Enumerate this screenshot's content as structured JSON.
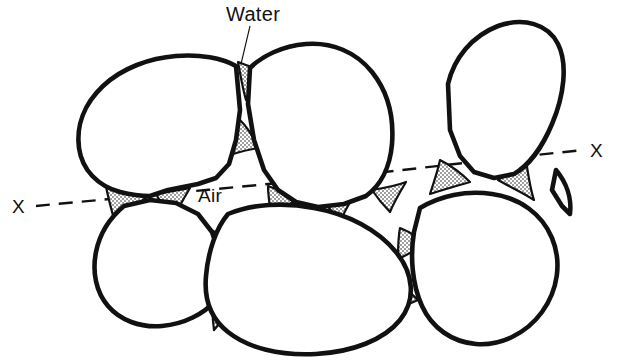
{
  "figure": {
    "kind": "soil-particle-water-air-diagram",
    "title": "",
    "background_color": "#ffffff",
    "ink_color": "#111111",
    "outline_color": "#111111",
    "water_fill_label": "stipple",
    "air_fill_color": "#ffffff"
  },
  "labels": {
    "water": "Water",
    "air": "Air",
    "section_left": "X",
    "section_right": "X"
  },
  "annotations": {
    "leader_line": {
      "from_label": "Water",
      "x1": 250,
      "y1": 26,
      "x2": 241,
      "y2": 64
    },
    "section_line": {
      "style": "dashed",
      "label": "X",
      "x1": 36,
      "y1": 206,
      "x2": 583,
      "y2": 150
    }
  },
  "particles": [
    {
      "name": "particle-upper-left",
      "path": "M 236,66 C 222,58 200,54 176,56 C 150,58 122,68 103,86 C 84,104 76,126 79,148 C 82,170 98,186 120,192 C 132,195 142,196 150,196 L 168,190 L 198,184 L 216,178 L 229,164 L 236,140 L 240,110 Z"
    },
    {
      "name": "particle-upper-middle",
      "path": "M 250,68 C 262,56 282,46 306,44 C 332,42 356,52 372,72 C 388,92 394,118 392,144 C 390,168 380,186 366,196 L 344,204 L 318,207 L 296,202 L 278,190 L 264,170 L 254,140 L 248,104 Z"
    },
    {
      "name": "particle-upper-right",
      "path": "M 448,84 C 454,58 472,36 498,26 C 524,17 548,24 558,44 C 568,64 564,96 552,124 C 542,148 528,166 514,174 L 494,178 L 474,172 L 460,156 L 450,130 Z"
    },
    {
      "name": "particle-lower-left",
      "path": "M 124,206 C 112,216 100,232 96,252 C 92,272 96,292 108,306 C 120,320 140,328 162,326 C 184,324 204,314 216,300 L 222,280 L 220,256 L 212,232 L 198,214 L 176,203 L 150,200 Z"
    },
    {
      "name": "particle-bottom-center",
      "path": "M 228,214 C 252,204 284,202 314,208 C 348,214 378,230 396,252 C 414,274 416,300 400,320 C 384,340 352,352 316,354 C 280,356 248,348 228,332 C 210,318 204,298 206,276 C 208,252 216,228 228,214 Z"
    },
    {
      "name": "particle-bottom-right",
      "path": "M 420,208 C 440,196 466,190 492,194 C 520,198 542,214 552,238 C 562,262 558,290 542,312 C 526,334 500,346 476,344 C 452,342 432,328 422,306 C 412,284 410,256 414,232 Z"
    },
    {
      "name": "particle-right-middle",
      "path": "M 556,170 C 566,182 572,198 570,214 L 562,206 L 552,190 Z"
    }
  ],
  "water_wedges": [
    {
      "name": "water-wedge-top-center",
      "path": "M 238,62 C 248,66 258,70 266,66 C 258,78 250,88 246,100 C 242,86 240,72 238,62 Z"
    },
    {
      "name": "water-wedge-mid-upper",
      "path": "M 240,120 C 248,128 254,138 258,148 C 248,150 236,152 228,156 C 232,142 236,130 240,120 Z"
    },
    {
      "name": "water-wedge-left-contact",
      "path": "M 106,186 C 120,190 134,194 146,198 C 134,206 124,216 116,226 C 112,212 108,198 106,186 Z"
    },
    {
      "name": "water-wedge-air-upper-left",
      "path": "M 156,194 C 168,192 180,190 190,188 C 184,198 178,208 174,218 C 166,210 160,202 156,194 Z"
    },
    {
      "name": "water-wedge-air-right",
      "path": "M 268,186 C 278,190 290,194 300,196 C 290,204 280,212 272,220 C 270,208 268,196 268,186 Z"
    },
    {
      "name": "water-wedge-air-lower",
      "path": "M 208,228 C 216,232 224,238 228,246 C 220,254 214,264 210,274 C 206,258 206,242 208,228 Z"
    },
    {
      "name": "water-wedge-center-contact",
      "path": "M 320,196 C 332,196 346,194 356,192 C 350,202 344,212 340,222 C 332,212 326,204 320,196 Z"
    },
    {
      "name": "water-wedge-right-of-center",
      "path": "M 372,190 C 384,188 396,186 406,182 C 400,192 394,202 390,212 C 382,204 376,196 372,190 Z"
    },
    {
      "name": "water-wedge-right-left-lobe",
      "path": "M 440,160 C 452,166 462,174 470,182 C 456,186 442,190 430,194 C 434,182 438,170 440,160 Z"
    },
    {
      "name": "water-wedge-right-right-lobe",
      "path": "M 498,180 C 508,174 518,168 526,160 C 528,174 530,188 534,200 C 522,192 508,186 498,180 Z"
    },
    {
      "name": "water-wedge-right-below",
      "path": "M 400,228 C 410,232 420,238 426,246 C 416,250 406,254 398,260 C 398,248 398,238 400,228 Z"
    },
    {
      "name": "water-wedge-bottom-right-contact",
      "path": "M 390,278 C 400,284 410,292 418,300 C 404,306 390,312 378,318 C 382,304 386,290 390,278 Z"
    },
    {
      "name": "water-wedge-lower-left-contact",
      "path": "M 214,292 C 224,296 232,302 238,310 C 228,316 220,322 214,330 C 212,316 212,304 214,292 Z"
    }
  ]
}
